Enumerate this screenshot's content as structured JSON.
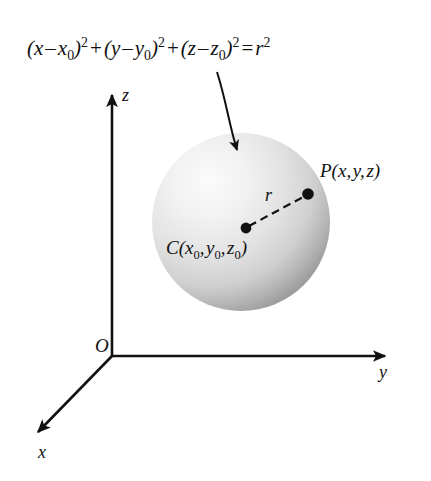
{
  "figure": {
    "background_color": "#ffffff",
    "ink_color": "#111111",
    "sphere_fill_light": "#f2f2f2",
    "sphere_fill_mid": "#d8d8d8",
    "sphere_fill_dark": "#9a9a9a"
  },
  "equation": {
    "full_text": "(x - x0)^2 + (y - y0)^2 + (z - z0)^2 = r^2",
    "term1_var": "x",
    "term1_sub": "0",
    "term2_var": "y",
    "term2_sub": "0",
    "term3_var": "z",
    "term3_sub": "0",
    "exponent": "2",
    "minus": "–",
    "plus": "+",
    "equals": "=",
    "open_paren": "(",
    "close_paren": ")",
    "radius_var": "r"
  },
  "axes": {
    "z_label": "z",
    "y_label": "y",
    "x_label": "x",
    "origin_label": "O"
  },
  "sphere": {
    "center_label_name": "C",
    "center_label_coords": "(x0, y0, z0)",
    "center_var1": "x",
    "center_var2": "y",
    "center_var3": "z",
    "center_sub": "0",
    "point_label_name": "P",
    "point_label_coords": "(x, y, z)",
    "point_var1": "x",
    "point_var2": "y",
    "point_var3": "z",
    "radius_label": "r",
    "comma": ",",
    "open_paren": "(",
    "close_paren": ")"
  }
}
